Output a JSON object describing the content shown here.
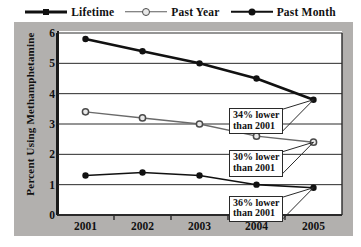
{
  "legend": {
    "items": [
      {
        "label": "Lifetime",
        "marker": "filled-square-marker",
        "color": "#111111"
      },
      {
        "label": "Past Year",
        "marker": "open-circle-marker",
        "color": "#5d5d5d"
      },
      {
        "label": "Past Month",
        "marker": "filled-circle-marker",
        "color": "#111111"
      }
    ]
  },
  "axes": {
    "ylabel": "Percent Using Methamphetamine",
    "yticks": [
      "0",
      "1",
      "2",
      "3",
      "4",
      "5",
      "6"
    ],
    "xticks": [
      "2001",
      "2002",
      "2003",
      "2004",
      "2005"
    ]
  },
  "annotations": [
    {
      "line1": "34% lower",
      "line2": "than 2001",
      "series": "Lifetime"
    },
    {
      "line1": "30% lower",
      "line2": "than 2001",
      "series": "Past Year"
    },
    {
      "line1": "36% lower",
      "line2": "than 2001",
      "series": "Past Month"
    }
  ],
  "chart_data": {
    "type": "line",
    "title": "",
    "xlabel": "",
    "ylabel": "Percent Using Methamphetamine",
    "categories": [
      "2001",
      "2002",
      "2003",
      "2004",
      "2005"
    ],
    "ylim": [
      0,
      6
    ],
    "ytick_step": 1,
    "grid": true,
    "legend_position": "top",
    "series": [
      {
        "name": "Lifetime",
        "values": [
          5.8,
          5.4,
          5.0,
          4.5,
          3.8
        ],
        "color": "#111111",
        "marker": "filled-circle",
        "linewidth": 2.6
      },
      {
        "name": "Past Year",
        "values": [
          3.4,
          3.2,
          3.0,
          2.6,
          2.4
        ],
        "color": "#6a6a6a",
        "marker": "open-circle",
        "linewidth": 1.4
      },
      {
        "name": "Past Month",
        "values": [
          1.3,
          1.4,
          1.3,
          1.0,
          0.9
        ],
        "color": "#111111",
        "marker": "filled-circle",
        "linewidth": 1.6
      }
    ],
    "annotations": [
      {
        "text": "34% lower than 2001",
        "attached_to": "Lifetime",
        "at_category": "2005"
      },
      {
        "text": "30% lower than 2001",
        "attached_to": "Past Year",
        "at_category": "2005"
      },
      {
        "text": "36% lower than 2001",
        "attached_to": "Past Month",
        "at_category": "2005"
      }
    ]
  }
}
